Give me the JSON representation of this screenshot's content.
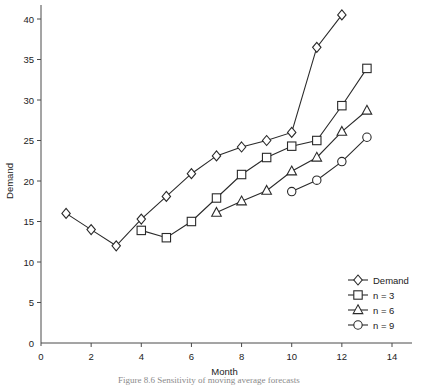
{
  "chart_data": {
    "type": "line",
    "title": "",
    "xlabel": "Month",
    "ylabel": "Demand",
    "xlim": [
      0,
      14.8
    ],
    "ylim": [
      0,
      41.5
    ],
    "xticks": [
      0,
      2,
      4,
      6,
      8,
      10,
      12,
      14
    ],
    "yticks": [
      0,
      5,
      10,
      15,
      20,
      25,
      30,
      35,
      40
    ],
    "grid": false,
    "legend_position": "bottom-right",
    "series": [
      {
        "name": "Demand",
        "marker": "diamond",
        "x": [
          1,
          2,
          3,
          4,
          5,
          6,
          7,
          8,
          9,
          10,
          11,
          12
        ],
        "values": [
          16.0,
          14.0,
          12.0,
          15.3,
          18.1,
          20.9,
          23.1,
          24.2,
          25.0,
          26.0,
          36.5,
          40.5
        ]
      },
      {
        "name": "n = 3",
        "marker": "square",
        "x": [
          4,
          5,
          6,
          7,
          8,
          9,
          10,
          11,
          12,
          13
        ],
        "values": [
          13.9,
          13.0,
          15.0,
          17.9,
          20.8,
          22.9,
          24.3,
          25.0,
          29.3,
          33.9
        ]
      },
      {
        "name": "n = 6",
        "marker": "triangle",
        "x": [
          7,
          8,
          9,
          10,
          11,
          12,
          13
        ],
        "values": [
          16.1,
          17.5,
          18.8,
          21.2,
          22.9,
          26.1,
          28.7
        ]
      },
      {
        "name": "n = 9",
        "marker": "circle",
        "x": [
          10,
          11,
          12,
          13
        ],
        "values": [
          18.7,
          20.1,
          22.4,
          25.4
        ]
      }
    ]
  },
  "axis": {
    "x_title": "Month",
    "y_title": "Demand",
    "x_tick_labels": [
      "0",
      "2",
      "4",
      "6",
      "8",
      "10",
      "12",
      "14"
    ],
    "y_tick_labels": [
      "0",
      "5",
      "10",
      "15",
      "20",
      "25",
      "30",
      "35",
      "40"
    ]
  },
  "legend": {
    "entries": [
      {
        "label": "Demand",
        "marker": "diamond"
      },
      {
        "label": "n = 3",
        "marker": "square"
      },
      {
        "label": "n = 6",
        "marker": "triangle"
      },
      {
        "label": "n = 9",
        "marker": "circle"
      }
    ]
  },
  "caption": {
    "text": "Figure 8.6   Sensitivity of moving average forecasts"
  }
}
